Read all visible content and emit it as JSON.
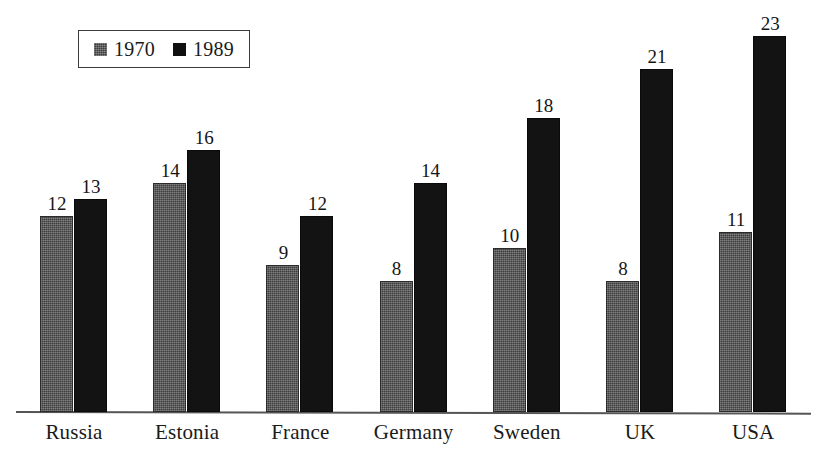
{
  "chart_data": {
    "type": "bar",
    "title": "",
    "subtitle": "",
    "xlabel": "",
    "ylabel": "",
    "ylim": [
      0,
      23
    ],
    "grid": false,
    "legend_position": "top-left",
    "categories": [
      "Russia",
      "Estonia",
      "France",
      "Germany",
      "Sweden",
      "UK",
      "USA"
    ],
    "series": [
      {
        "name": "1970",
        "color": "#3d3d3d",
        "values": [
          12,
          14,
          9,
          8,
          10,
          8,
          11
        ]
      },
      {
        "name": "1989",
        "color": "#131313",
        "values": [
          13,
          16,
          12,
          14,
          18,
          21,
          23
        ]
      }
    ],
    "annotations": {
      "data_labels_shown": true
    }
  },
  "legend": {
    "entries": [
      {
        "label": "1970",
        "swatch": "gray-square-icon"
      },
      {
        "label": "1989",
        "swatch": "black-square-icon"
      }
    ]
  },
  "axis": {
    "baseline_visible": true
  }
}
